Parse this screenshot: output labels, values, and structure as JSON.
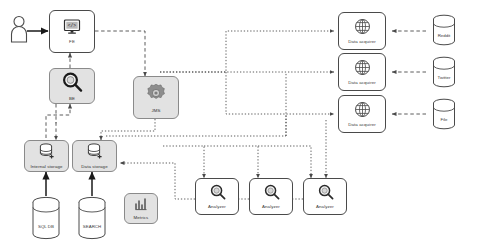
{
  "diagram": {
    "background": "#ffffff",
    "node_fill": "#ffffff",
    "node_shaded_fill": "#e2e2e2",
    "stroke": "#4a4a4a",
    "arrow_solid": "#1a1a1a",
    "arrow_dashed": "#555555"
  },
  "nodes": {
    "actor": {
      "label": "",
      "icon": "user-icon"
    },
    "fe": {
      "label": "FE",
      "icon": "monitor-icon"
    },
    "be": {
      "label": "BE",
      "icon": "magnifier-icon"
    },
    "jms": {
      "label": "JMS",
      "icon": "gear-icon"
    },
    "internal_storage": {
      "label": "Internal storage",
      "icon": "database-icon"
    },
    "data_storage": {
      "label": "Data storage",
      "icon": "database-icon"
    },
    "sql_db": {
      "label": "SQL DB",
      "icon": "cylinder-icon"
    },
    "search": {
      "label": "SEARCH",
      "icon": "cylinder-icon"
    },
    "metrics": {
      "label": "Metrics",
      "icon": "bar-chart-icon"
    },
    "analyzer_1": {
      "label": "Analyzer",
      "icon": "magnifier-icon"
    },
    "analyzer_2": {
      "label": "Analyzer",
      "icon": "magnifier-icon"
    },
    "analyzer_3": {
      "label": "Analyzer",
      "icon": "magnifier-icon"
    },
    "data_acquirer_1": {
      "label": "Data acquirer",
      "icon": "globe-icon"
    },
    "data_acquirer_2": {
      "label": "Data acquirer",
      "icon": "globe-icon"
    },
    "data_acquirer_3": {
      "label": "Data acquirer",
      "icon": "globe-icon"
    },
    "source_reddit": {
      "label": "Reddit",
      "icon": "cylinder-icon"
    },
    "source_twitter": {
      "label": "Twitter",
      "icon": "cylinder-icon"
    },
    "source_file": {
      "label": "File",
      "icon": "cylinder-icon"
    }
  },
  "edges": [
    {
      "from": "actor",
      "to": "fe",
      "style": "solid"
    },
    {
      "from": "fe",
      "to": "jms",
      "style": "dashed"
    },
    {
      "from": "be",
      "to": "fe",
      "style": "dashed"
    },
    {
      "from": "internal_storage",
      "to": "be",
      "style": "dashed"
    },
    {
      "from": "be",
      "to": "internal_storage",
      "style": "dashed"
    },
    {
      "from": "jms",
      "to": "data_storage",
      "style": "dotted"
    },
    {
      "from": "jms",
      "to": "data_acquirer_1",
      "style": "dotted"
    },
    {
      "from": "jms",
      "to": "data_acquirer_2",
      "style": "dotted"
    },
    {
      "from": "jms",
      "to": "data_acquirer_3",
      "style": "dotted"
    },
    {
      "from": "jms",
      "to": "analyzer_1",
      "style": "dotted"
    },
    {
      "from": "jms",
      "to": "analyzer_2",
      "style": "dotted"
    },
    {
      "from": "jms",
      "to": "analyzer_3",
      "style": "dotted"
    },
    {
      "from": "analyzer_3",
      "to": "analyzer_2",
      "style": "dotted"
    },
    {
      "from": "analyzer_2",
      "to": "analyzer_1",
      "style": "dotted"
    },
    {
      "from": "analyzer_1",
      "to": "data_storage",
      "style": "dotted"
    },
    {
      "from": "source_reddit",
      "to": "data_acquirer_1",
      "style": "dashed"
    },
    {
      "from": "source_twitter",
      "to": "data_acquirer_2",
      "style": "dashed"
    },
    {
      "from": "source_file",
      "to": "data_acquirer_3",
      "style": "dashed"
    },
    {
      "from": "sql_db",
      "to": "internal_storage",
      "style": "solid"
    },
    {
      "from": "search",
      "to": "data_storage",
      "style": "solid"
    }
  ]
}
